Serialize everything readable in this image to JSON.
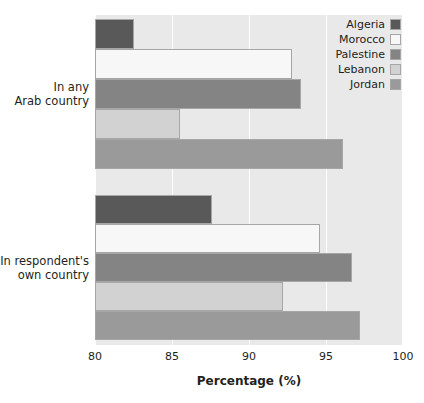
{
  "chart_data": {
    "type": "bar",
    "orientation": "horizontal",
    "title": "",
    "xlabel": "Percentage (%)",
    "ylabel": "",
    "xlim": [
      80,
      100
    ],
    "xticks": [
      80,
      85,
      90,
      95,
      100
    ],
    "xtick_labels": [
      "80",
      "85",
      "90",
      "95",
      "100"
    ],
    "grid": true,
    "grid_axis": "x",
    "legend_position": "top-right",
    "categories": [
      "In any\nArab country",
      "In respondent's\nown country"
    ],
    "category_labels": [
      {
        "line1": "In any",
        "line2": "Arab country"
      },
      {
        "line1": "In respondent's",
        "line2": "own country"
      }
    ],
    "series": [
      {
        "name": "Algeria",
        "color": "#595959",
        "values": [
          82.5,
          87.6
        ]
      },
      {
        "name": "Morocco",
        "color": "#f7f7f7",
        "values": [
          92.8,
          94.6
        ]
      },
      {
        "name": "Palestine",
        "color": "#848484",
        "values": [
          93.4,
          96.7
        ]
      },
      {
        "name": "Lebanon",
        "color": "#d2d2d2",
        "values": [
          85.5,
          92.2
        ]
      },
      {
        "name": "Jordan",
        "color": "#9a9a9a",
        "values": [
          96.1,
          97.2
        ]
      }
    ]
  },
  "legend": {
    "items": [
      {
        "label": "Algeria",
        "color": "#595959"
      },
      {
        "label": "Morocco",
        "color": "#f7f7f7"
      },
      {
        "label": "Palestine",
        "color": "#848484"
      },
      {
        "label": "Lebanon",
        "color": "#d2d2d2"
      },
      {
        "label": "Jordan",
        "color": "#9a9a9a"
      }
    ]
  },
  "axis": {
    "x_title": "Percentage (%)",
    "tick_labels": [
      "80",
      "85",
      "90",
      "95",
      "100"
    ]
  },
  "colors": {
    "plot_background": "#e9e9e9",
    "gridline": "#ffffff",
    "bar_border": "#a6a6a6",
    "text": "#231f20"
  }
}
